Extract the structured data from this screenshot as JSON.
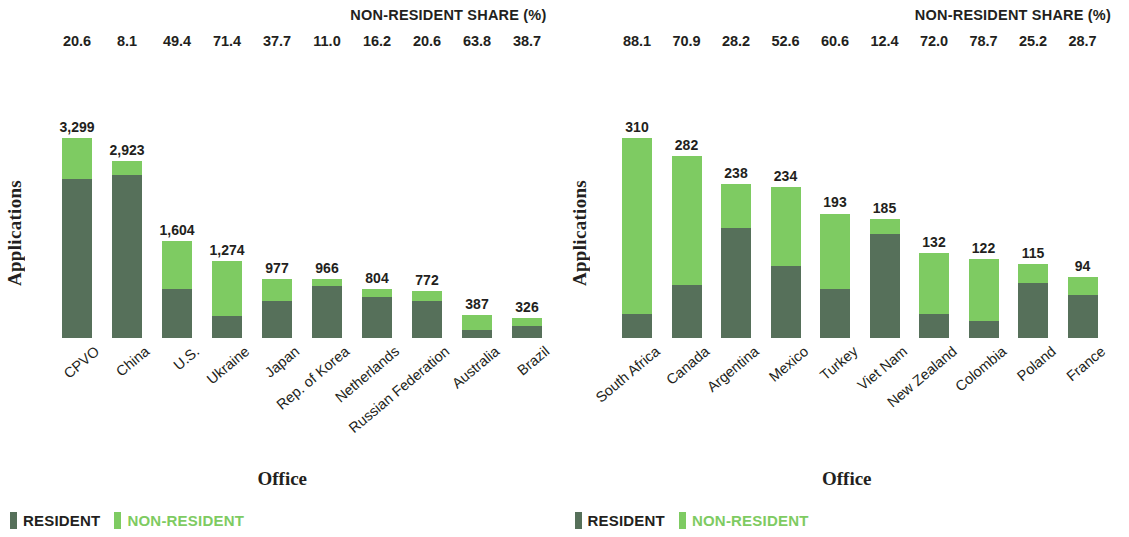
{
  "colors": {
    "resident": "#56705a",
    "non_resident": "#7ecb62",
    "text": "#231f20"
  },
  "legend": {
    "resident_label": "RESIDENT",
    "non_resident_label": "NON-RESIDENT"
  },
  "panels": [
    {
      "share_title": "NON-RESIDENT SHARE (%)",
      "y_title": "Applications",
      "x_title": "Office"
    },
    {
      "share_title": "NON-RESIDENT SHARE (%)",
      "y_title": "Applications",
      "x_title": "Office"
    }
  ],
  "chart_data": [
    {
      "type": "bar",
      "stacked": true,
      "title": "NON-RESIDENT SHARE (%)",
      "xlabel": "Office",
      "ylabel": "Applications",
      "categories": [
        "CPVO",
        "China",
        "U.S.",
        "Ukraine",
        "Japan",
        "Rep. of Korea",
        "Netherlands",
        "Russian Federation",
        "Australia",
        "Brazil"
      ],
      "totals": [
        3299,
        2923,
        1604,
        1274,
        977,
        966,
        804,
        772,
        387,
        326
      ],
      "total_labels": [
        "3,299",
        "2,923",
        "1,604",
        "1,274",
        "977",
        "966",
        "804",
        "772",
        "387",
        "326"
      ],
      "non_resident_share_pct": [
        20.6,
        8.1,
        49.4,
        71.4,
        37.7,
        11.0,
        16.2,
        20.6,
        63.8,
        38.7
      ],
      "non_resident_share_labels": [
        "20.6",
        "8.1",
        "49.4",
        "71.4",
        "37.7",
        "11.0",
        "16.2",
        "20.6",
        "63.8",
        "38.7"
      ],
      "series": [
        {
          "name": "RESIDENT",
          "color": "#56705a",
          "values": [
            2620,
            2686,
            812,
            364,
            609,
            860,
            674,
            613,
            140,
            200
          ]
        },
        {
          "name": "NON-RESIDENT",
          "color": "#7ecb62",
          "values": [
            679,
            237,
            792,
            910,
            368,
            106,
            130,
            159,
            247,
            126
          ]
        }
      ],
      "ylim": [
        0,
        3299
      ],
      "grid": false,
      "legend_position": "bottom-left"
    },
    {
      "type": "bar",
      "stacked": true,
      "title": "NON-RESIDENT SHARE (%)",
      "xlabel": "Office",
      "ylabel": "Applications",
      "categories": [
        "South Africa",
        "Canada",
        "Argentina",
        "Mexico",
        "Turkey",
        "Viet Nam",
        "New Zealand",
        "Colombia",
        "Poland",
        "France"
      ],
      "totals": [
        310,
        282,
        238,
        234,
        193,
        185,
        132,
        122,
        115,
        94
      ],
      "total_labels": [
        "310",
        "282",
        "238",
        "234",
        "193",
        "185",
        "132",
        "122",
        "115",
        "94"
      ],
      "non_resident_share_pct": [
        88.1,
        70.9,
        28.2,
        52.6,
        60.6,
        12.4,
        72.0,
        78.7,
        25.2,
        28.7
      ],
      "non_resident_share_labels": [
        "88.1",
        "70.9",
        "28.2",
        "52.6",
        "60.6",
        "12.4",
        "72.0",
        "78.7",
        "25.2",
        "28.7"
      ],
      "series": [
        {
          "name": "RESIDENT",
          "color": "#56705a",
          "values": [
            37,
            82,
            171,
            111,
            76,
            162,
            37,
            26,
            86,
            67
          ]
        },
        {
          "name": "NON-RESIDENT",
          "color": "#7ecb62",
          "values": [
            273,
            200,
            67,
            123,
            117,
            23,
            95,
            96,
            29,
            27
          ]
        }
      ],
      "ylim": [
        0,
        310
      ],
      "grid": false,
      "legend_position": "bottom-left"
    }
  ]
}
